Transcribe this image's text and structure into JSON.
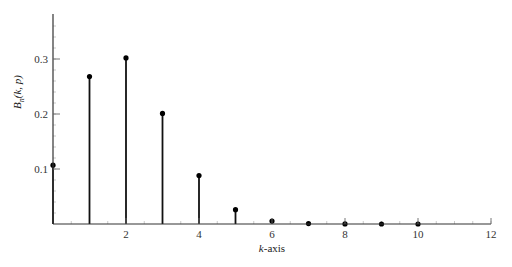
{
  "chart_data": {
    "type": "stem",
    "title": "",
    "xlabel": "k-axis",
    "ylabel": "B_n(k, p)",
    "ylabel_parts": {
      "base": "B",
      "sub": "n",
      "args": "(k, p)"
    },
    "xlabel_parts": {
      "var": "k",
      "rest": "-axis"
    },
    "x": [
      0,
      1,
      2,
      3,
      4,
      5,
      6,
      7,
      8,
      9,
      10
    ],
    "values": [
      0.107,
      0.268,
      0.302,
      0.201,
      0.088,
      0.026,
      0.0055,
      0.0008,
      0.0001,
      0.0,
      0.0
    ],
    "xlim": [
      0,
      12
    ],
    "ylim": [
      0,
      0.38
    ],
    "x_ticks": [
      2,
      4,
      6,
      8,
      10,
      12
    ],
    "x_tick_labels": [
      "2",
      "4",
      "6",
      "8",
      "10",
      "12"
    ],
    "y_ticks": [
      0.1,
      0.2,
      0.3
    ],
    "y_tick_labels": [
      "0.1",
      "0.2",
      "0.3"
    ],
    "grid": false,
    "legend": null,
    "colors": {
      "stem": "#111111",
      "axis": "#333333",
      "marker": "#000000"
    }
  }
}
